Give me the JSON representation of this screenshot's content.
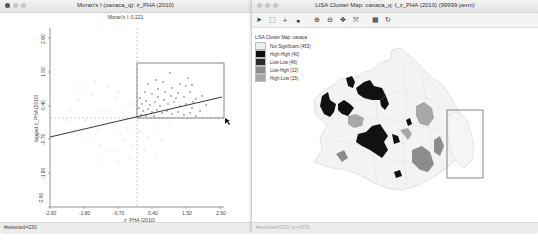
{
  "left_window": {
    "title": "Moran's I (oaxaca_q): z_PHA (2010)",
    "subtitle": "Moran's I: 0.221",
    "x_axis": {
      "label": "z_PHA (2010)",
      "ticks": [
        "-2.90",
        "-1.80",
        "-0.70",
        "0.40",
        "1.50",
        "2.60"
      ]
    },
    "y_axis": {
      "label": "lagged z_PHA (2010)",
      "ticks": [
        "-2.90",
        "-1.80",
        "-0.70",
        "0.40",
        "1.50",
        "2.60"
      ]
    },
    "status": "#selected=230"
  },
  "right_window": {
    "title": "LISA Cluster Map: oaxaca_q: I_z_PHA (2010) (99999 perm)",
    "toolbar": [
      {
        "name": "select-pointer-icon",
        "glyph": "➤"
      },
      {
        "name": "select-rect-icon",
        "glyph": "⬚"
      },
      {
        "name": "pan-icon",
        "glyph": "+"
      },
      {
        "name": "layers-icon",
        "glyph": "●"
      },
      {
        "name": "zoom-in-icon",
        "glyph": "⊕"
      },
      {
        "name": "zoom-out-icon",
        "glyph": "⊖"
      },
      {
        "name": "move-icon",
        "glyph": "✥"
      },
      {
        "name": "fit-extent-icon",
        "glyph": "⤧"
      },
      {
        "name": "table-icon",
        "glyph": "▦"
      },
      {
        "name": "refresh-icon",
        "glyph": "↻"
      }
    ],
    "legend": {
      "title": "LISA Cluster Map: oaxaca",
      "items": [
        {
          "label": "Not Significant (453)",
          "color": "#eeeeee"
        },
        {
          "label": "High-High (40)",
          "color": "#111111"
        },
        {
          "label": "Low-Low (46)",
          "color": "#2b2b2b"
        },
        {
          "label": "Low-High (12)",
          "color": "#8c8c8c"
        },
        {
          "label": "High-Low (15)",
          "color": "#a8a8a8"
        }
      ]
    },
    "status": "#selected=230, s:n=575"
  }
}
